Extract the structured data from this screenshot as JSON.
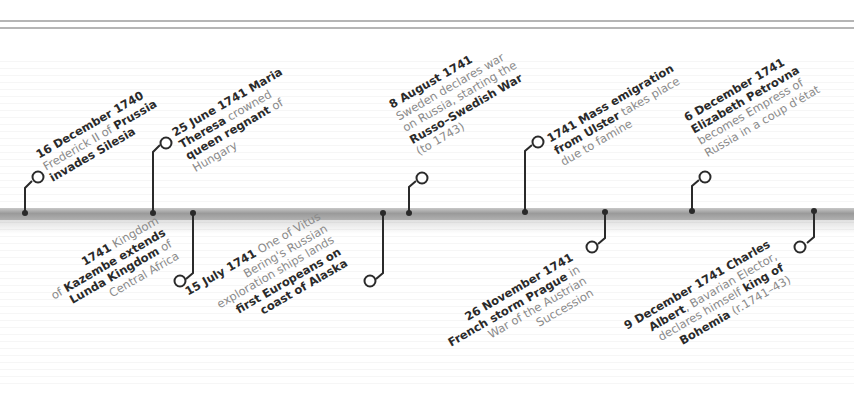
{
  "colors": {
    "bold_text": "#2a2a2a",
    "regular_text": "#8a8a8a",
    "timeline_bar": "#a8a8a8",
    "connector": "#2a2a2a"
  },
  "events": [
    {
      "id": "e1",
      "position": "above",
      "x": 25,
      "lines": [
        [
          {
            "t": "16 December 1740",
            "b": true
          }
        ],
        [
          {
            "t": "Frederick II of ",
            "b": false
          },
          {
            "t": "Prussia",
            "b": true
          }
        ],
        [
          {
            "t": "invades Silesia",
            "b": true
          }
        ]
      ]
    },
    {
      "id": "e2",
      "position": "above",
      "x": 153,
      "lines": [
        [
          {
            "t": "25 June 1741 ",
            "b": true
          },
          {
            "t": "Maria",
            "b": true
          }
        ],
        [
          {
            "t": "Theresa",
            "b": true
          },
          {
            "t": " crowned",
            "b": false
          }
        ],
        [
          {
            "t": "queen regnant",
            "b": true
          },
          {
            "t": " of",
            "b": false
          }
        ],
        [
          {
            "t": "Hungary",
            "b": false
          }
        ]
      ]
    },
    {
      "id": "e3",
      "position": "below",
      "x": 193,
      "lines": [
        [
          {
            "t": "1741",
            "b": true
          },
          {
            "t": " Kingdom",
            "b": false
          }
        ],
        [
          {
            "t": "of ",
            "b": false
          },
          {
            "t": "Kazembe extends",
            "b": true
          }
        ],
        [
          {
            "t": "Lunda Kingdom",
            "b": true
          },
          {
            "t": " of",
            "b": false
          }
        ],
        [
          {
            "t": "Central Africa",
            "b": false
          }
        ]
      ]
    },
    {
      "id": "e4",
      "position": "below",
      "x": 383,
      "lines": [
        [
          {
            "t": "15 July 1741",
            "b": true
          },
          {
            "t": " One of Vitus",
            "b": false
          }
        ],
        [
          {
            "t": "Bering's Russian",
            "b": false
          }
        ],
        [
          {
            "t": "exploration ships lands",
            "b": false
          }
        ],
        [
          {
            "t": "first Europeans on",
            "b": true
          }
        ],
        [
          {
            "t": "coast of Alaska",
            "b": true
          }
        ]
      ]
    },
    {
      "id": "e5",
      "position": "above",
      "x": 409,
      "lines": [
        [
          {
            "t": "8 August 1741",
            "b": true
          }
        ],
        [
          {
            "t": "Sweden declares war",
            "b": false
          }
        ],
        [
          {
            "t": "on Russia, starting the",
            "b": false
          }
        ],
        [
          {
            "t": "Russo–Swedish War",
            "b": true
          }
        ],
        [
          {
            "t": "(to 1743)",
            "b": false
          }
        ]
      ]
    },
    {
      "id": "e6",
      "position": "above",
      "x": 525,
      "lines": [
        [
          {
            "t": "1741 Mass emigration",
            "b": true
          }
        ],
        [
          {
            "t": "from Ulster",
            "b": true
          },
          {
            "t": " takes place",
            "b": false
          }
        ],
        [
          {
            "t": "due to famine",
            "b": false
          }
        ]
      ]
    },
    {
      "id": "e7",
      "position": "below",
      "x": 605,
      "lines": [
        [
          {
            "t": "26 November 1741",
            "b": true
          }
        ],
        [
          {
            "t": "French storm Prague",
            "b": true
          },
          {
            "t": " in",
            "b": false
          }
        ],
        [
          {
            "t": "War of the Austrian",
            "b": false
          }
        ],
        [
          {
            "t": "Succession",
            "b": false
          }
        ]
      ]
    },
    {
      "id": "e8",
      "position": "above",
      "x": 692,
      "lines": [
        [
          {
            "t": "6 December 1741",
            "b": true
          }
        ],
        [
          {
            "t": "Elizabeth Petrovna",
            "b": true
          }
        ],
        [
          {
            "t": "becomes Empress of",
            "b": false
          }
        ],
        [
          {
            "t": "Russia in a coup d'état",
            "b": false
          }
        ]
      ]
    },
    {
      "id": "e9",
      "position": "below",
      "x": 814,
      "lines": [
        [
          {
            "t": "9 December 1741 Charles",
            "b": true
          }
        ],
        [
          {
            "t": "Albert",
            "b": true
          },
          {
            "t": ", Bavarian Elector,",
            "b": false
          }
        ],
        [
          {
            "t": "declares himself ",
            "b": false
          },
          {
            "t": "king of",
            "b": true
          }
        ],
        [
          {
            "t": "Bohemia",
            "b": true
          },
          {
            "t": " (r.1741–43)",
            "b": false
          }
        ]
      ]
    }
  ]
}
